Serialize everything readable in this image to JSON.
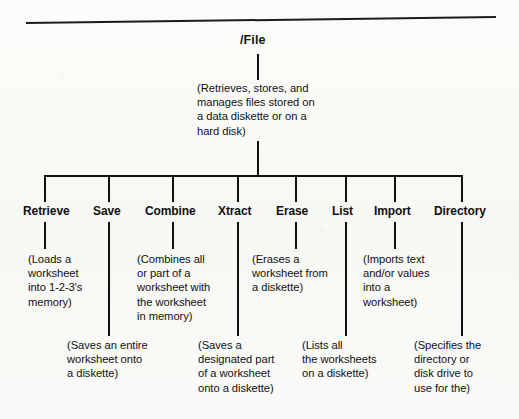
{
  "diagram": {
    "type": "tree",
    "root": {
      "label": "/File",
      "description": "(Retrieves, stores, and\nmanages files stored on\na data diskette or on a\nhard disk)"
    },
    "children": [
      {
        "label": "Retrieve",
        "description": "(Loads a\nworksheet\ninto 1-2-3's\nmemory)",
        "row": "upper"
      },
      {
        "label": "Save",
        "description": "(Saves an entire\nworksheet onto\na diskette)",
        "row": "lower"
      },
      {
        "label": "Combine",
        "description": "(Combines all\nor part of a\nworksheet with\nthe worksheet\nin memory)",
        "row": "upper"
      },
      {
        "label": "Xtract",
        "description": "(Saves a\ndesignated part\nof a worksheet\nonto a diskette)",
        "row": "lower"
      },
      {
        "label": "Erase",
        "description": "(Erases a\nworksheet from\na diskette)",
        "row": "upper"
      },
      {
        "label": "List",
        "description": "(Lists all\nthe worksheets\non a diskette)",
        "row": "lower"
      },
      {
        "label": "Import",
        "description": "(Imports text\nand/or values\ninto a\nworksheet)",
        "row": "upper"
      },
      {
        "label": "Directory",
        "description": "(Specifies the\ndirectory or\ndisk drive to\nuse for the)",
        "row": "lower"
      }
    ]
  },
  "style": {
    "line_color": "#111111",
    "text_color": "#111111",
    "paper_color": "#fbfbf9"
  }
}
